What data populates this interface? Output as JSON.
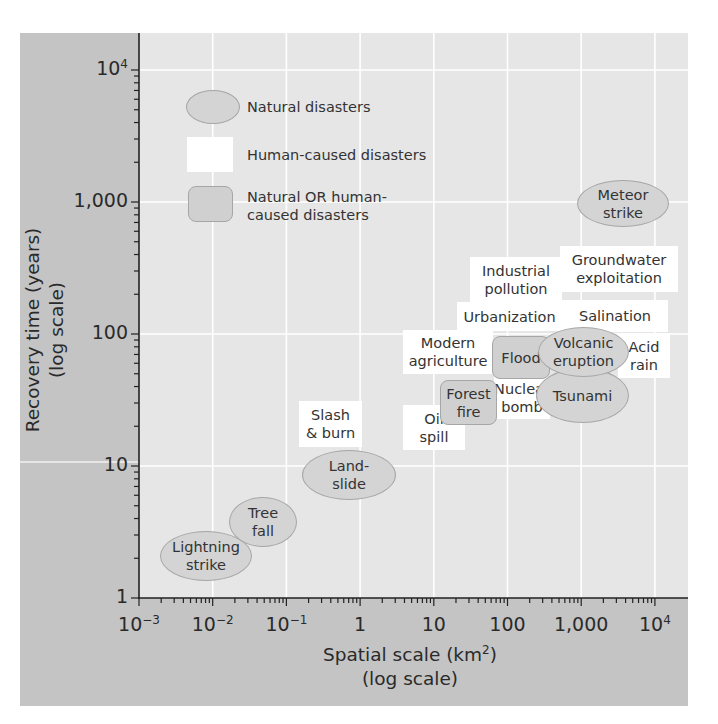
{
  "chart_data": {
    "type": "scatter",
    "title": "",
    "xlabel": "Spatial scale (km²) (log scale)",
    "xlabel_lines": [
      "Spatial scale (km",
      "2",
      ")",
      "(log scale)"
    ],
    "ylabel": "Recovery time (years) (log scale)",
    "ylabel_lines": [
      "Recovery time (years)",
      "(log scale)"
    ],
    "xscale": "log",
    "yscale": "log",
    "xlim": [
      0.001,
      10000
    ],
    "ylim": [
      1,
      10000
    ],
    "grid": true,
    "x_ticks": [
      {
        "base": "10",
        "exp": "−3",
        "value": 0.001
      },
      {
        "base": "10",
        "exp": "−2",
        "value": 0.01
      },
      {
        "base": "10",
        "exp": "−1",
        "value": 0.1
      },
      {
        "base": "1",
        "exp": "",
        "value": 1
      },
      {
        "base": "10",
        "exp": "",
        "value": 10
      },
      {
        "base": "100",
        "exp": "",
        "value": 100
      },
      {
        "base": "1,000",
        "exp": "",
        "value": 1000
      },
      {
        "base": "10",
        "exp": "4",
        "value": 10000
      }
    ],
    "y_ticks": [
      {
        "base": "1",
        "exp": "",
        "value": 1
      },
      {
        "base": "10",
        "exp": "",
        "value": 10
      },
      {
        "base": "100",
        "exp": "",
        "value": 100
      },
      {
        "base": "1,000",
        "exp": "",
        "value": 1000
      },
      {
        "base": "10",
        "exp": "4",
        "value": 10000
      }
    ],
    "legend": {
      "position": "upper-left",
      "entries": [
        {
          "category": "natural",
          "label": "Natural disasters",
          "shape": "ellipse"
        },
        {
          "category": "human",
          "label": "Human-caused disasters",
          "shape": "rectangle"
        },
        {
          "category": "both",
          "label": "Natural OR human-\ncaused disasters",
          "shape": "rounded-rectangle"
        }
      ]
    },
    "points": [
      {
        "label": "Lightning\nstrike",
        "category": "natural",
        "x": 0.008,
        "y": 2.1,
        "box": [
          160,
          531,
          92,
          50
        ]
      },
      {
        "label": "Tree\nfall",
        "category": "natural",
        "x": 0.048,
        "y": 3.8,
        "box": [
          229,
          497,
          68,
          50
        ]
      },
      {
        "label": "Land-\nslide",
        "category": "natural",
        "x": 0.7,
        "y": 8.6,
        "box": [
          302,
          450,
          94,
          50
        ]
      },
      {
        "label": "Slash\n& burn",
        "category": "human",
        "x": 0.39,
        "y": 21,
        "box": [
          299,
          401,
          63,
          46
        ]
      },
      {
        "label": "Oil\nspill",
        "category": "human",
        "x": 10,
        "y": 20,
        "box": [
          403,
          405,
          62,
          45
        ]
      },
      {
        "label": "Modern\nagriculture",
        "category": "human",
        "x": 15,
        "y": 74,
        "box": [
          403,
          330,
          90,
          44
        ]
      },
      {
        "label": "Nuclear\nbomb",
        "category": "human",
        "x": 150,
        "y": 33,
        "box": [
          494,
          377,
          56,
          42
        ]
      },
      {
        "label": "Forest\nfire",
        "category": "both",
        "x": 29,
        "y": 30,
        "box": [
          440,
          380,
          57,
          45
        ]
      },
      {
        "label": "Flood",
        "category": "both",
        "x": 150,
        "y": 67,
        "box": [
          492,
          336,
          58,
          43
        ]
      },
      {
        "label": "Industrial\npollution",
        "category": "human",
        "x": 125,
        "y": 257,
        "box": [
          470,
          257,
          92,
          46
        ]
      },
      {
        "label": "Urbanization",
        "category": "human",
        "x": 100,
        "y": 137,
        "box": [
          457,
          302,
          105,
          29
        ]
      },
      {
        "label": "Groundwater\nexploitation",
        "category": "human",
        "x": 3200,
        "y": 310,
        "box": [
          560,
          246,
          118,
          46
        ]
      },
      {
        "label": "Salination",
        "category": "human",
        "x": 2900,
        "y": 137,
        "box": [
          562,
          300,
          106,
          32
        ]
      },
      {
        "label": "Acid\nrain",
        "category": "human",
        "x": 7000,
        "y": 70,
        "box": [
          618,
          333,
          52,
          45
        ]
      },
      {
        "label": "Tsunami",
        "category": "natural",
        "x": 1000,
        "y": 35,
        "box": [
          536,
          368,
          93,
          55
        ]
      },
      {
        "label": "Volcanic\neruption",
        "category": "natural",
        "x": 1000,
        "y": 73,
        "box": [
          538,
          327,
          91,
          50
        ]
      },
      {
        "label": "Meteor\nstrike",
        "category": "natural",
        "x": 3700,
        "y": 1000,
        "box": [
          577,
          180,
          92,
          47
        ]
      }
    ]
  },
  "colors": {
    "panel": "#c4c4c4",
    "plot_bg": "#e6e6e6",
    "grid": "#ffffff",
    "natural_fill": "#d4d4d4",
    "both_fill": "#d0d0d0",
    "human_fill": "#ffffff",
    "shape_border": "#a6a6a6",
    "text": "#2a2a2a"
  }
}
